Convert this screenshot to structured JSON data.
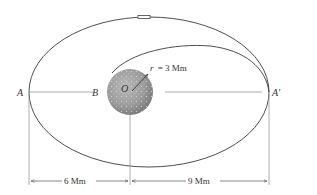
{
  "figure": {
    "points": {
      "A": "A",
      "B": "B",
      "O": "O",
      "A_prime": "A'"
    },
    "radius_label": "r = 3 Mm",
    "radius_var": "r",
    "radius_value": "= 3 Mm",
    "dimensions": {
      "left": "6 Mm",
      "right": "9 Mm"
    },
    "colors": {
      "orbit_line": "#3a3a3a",
      "guide_line": "#9a9a9a",
      "planet_fill": "#9b9b9b",
      "planet_dark": "#6f6f6f",
      "text": "#333333"
    }
  }
}
